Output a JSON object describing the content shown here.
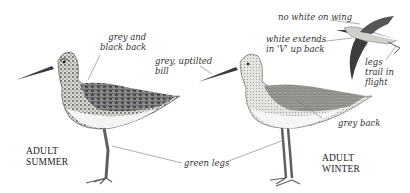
{
  "figure": {
    "birds": [
      {
        "id": "summer",
        "caption_line1": "ADULT",
        "caption_line2": "SUMMER"
      },
      {
        "id": "winter",
        "caption_line1": "ADULT",
        "caption_line2": "WINTER"
      },
      {
        "id": "flight"
      }
    ],
    "annotations": {
      "grey_black_back_1": "grey and",
      "grey_black_back_2": "black back",
      "upturned_bill_1": "grey, uptilted",
      "upturned_bill_2": "bill",
      "no_white_wing": "no white on wing",
      "white_v_1": "white extends",
      "white_v_2": "in 'V' up back",
      "legs_trail_1": "legs",
      "legs_trail_2": "trail in",
      "legs_trail_3": "flight",
      "grey_back": "grey back",
      "green_legs": "green legs"
    },
    "colors": {
      "ink": "#333333",
      "leader_line": "#777777",
      "dark_plumage": "#2b2b2b",
      "grey_plumage": "#8a8a8a",
      "belly": "#f2f2f2",
      "legs": "#6b6f66"
    }
  }
}
